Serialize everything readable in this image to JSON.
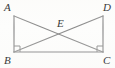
{
  "figure": {
    "type": "geometry-diagram",
    "background_color": "#fdfdfc",
    "stroke_color": "#777777",
    "label_color": "#3a3a3a",
    "labels": {
      "top_left": "A",
      "top_right": "D",
      "center": "E",
      "bottom_left": "B",
      "bottom_right": "C"
    },
    "points": {
      "A": {
        "x": 14,
        "y": 16
      },
      "D": {
        "x": 103,
        "y": 16
      },
      "B": {
        "x": 14,
        "y": 52
      },
      "C": {
        "x": 103,
        "y": 52
      },
      "E": {
        "x": 58.5,
        "y": 34
      }
    },
    "segments": [
      {
        "name": "side-AB",
        "from": "A",
        "to": "B"
      },
      {
        "name": "side-DC",
        "from": "D",
        "to": "C"
      },
      {
        "name": "base-BC",
        "from": "B",
        "to": "C"
      },
      {
        "name": "diagonal-AC",
        "from": "A",
        "to": "C"
      },
      {
        "name": "diagonal-DB",
        "from": "D",
        "to": "B"
      }
    ],
    "right_angle_marks": [
      {
        "name": "right-angle-at-B",
        "vertex": "B",
        "size": 6
      },
      {
        "name": "right-angle-at-C",
        "vertex": "C",
        "size": 6
      }
    ]
  }
}
